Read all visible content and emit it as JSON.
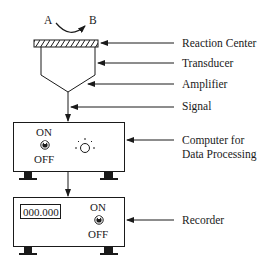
{
  "reaction": {
    "from": "A",
    "to": "B"
  },
  "labels": {
    "reaction_center": "Reaction Center",
    "transducer": "Transducer",
    "amplifier": "Amplifier",
    "signal": "Signal",
    "computer_line1": "Computer for",
    "computer_line2": "Data Processing",
    "recorder": "Recorder"
  },
  "computer": {
    "switch_on": "ON",
    "switch_off": "OFF",
    "indicator": "lamp-icon"
  },
  "recorder": {
    "display_value": "000.000",
    "switch_on": "ON",
    "switch_off": "OFF"
  },
  "colors": {
    "stroke": "#1a1a1a",
    "background": "#ffffff"
  }
}
